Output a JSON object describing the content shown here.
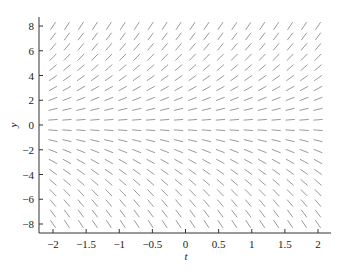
{
  "chart_data": {
    "type": "slope_field",
    "title": "",
    "equation_implied": "dy/dt = y",
    "xlabel": "t",
    "ylabel": "y",
    "xlim": [
      -2.2,
      2.2
    ],
    "ylim": [
      -8.7,
      8.7
    ],
    "x_ticks": [
      -2,
      -1.5,
      -1,
      -0.5,
      0,
      0.5,
      1,
      1.5,
      2
    ],
    "x_tick_labels": [
      "−2",
      "−1.5",
      "−1",
      "−0.5",
      "0",
      "0.5",
      "1",
      "1.5",
      "2"
    ],
    "y_ticks": [
      8,
      6,
      4,
      2,
      0,
      -2,
      -4,
      -6,
      -8
    ],
    "y_tick_labels": [
      "8",
      "6",
      "4",
      "2",
      "0",
      "−2",
      "−4",
      "−6",
      "−8"
    ],
    "grid": false,
    "legend": null,
    "field_grid": {
      "t_min": -2,
      "t_max": 2,
      "t_count": 20,
      "y_min": -8,
      "y_max": 8,
      "y_count": 20
    },
    "segment_color": "#9a9a9a",
    "axis_color": "#333333"
  },
  "layout": {
    "plot_left": 39,
    "plot_bottom": 233,
    "plot_top": 17,
    "plot_right": 331,
    "t_to_px": {
      "t0": -2,
      "px0": 53,
      "t1": 2,
      "px1": 318
    },
    "y_to_px": {
      "y0": 8,
      "py0": 26,
      "y1": -8,
      "py1": 224
    },
    "segment_length_px": 8.5
  }
}
